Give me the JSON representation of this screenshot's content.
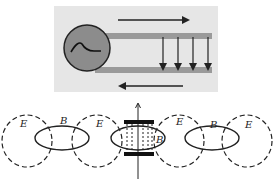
{
  "top_diagram": {
    "description": "AC source driving a two-wire transmission line with current arrows and electric field arrows between wires",
    "colors": {
      "panel": "#e6e6e6",
      "source_fill": "#8c8c8c",
      "wire": "#9a9a9a",
      "arrow": "#222222"
    },
    "source_icon": "sine-wave-icon",
    "field_arrow_count": 4
  },
  "bottom_diagram": {
    "description": "Alternating electric (E, dashed) and magnetic (B, solid) field loops along an axis with a capacitor at center",
    "labels": {
      "e1": "E",
      "b1": "B",
      "e2": "E",
      "b_center": "B",
      "e3": "E",
      "b2": "B",
      "e4": "E"
    }
  }
}
